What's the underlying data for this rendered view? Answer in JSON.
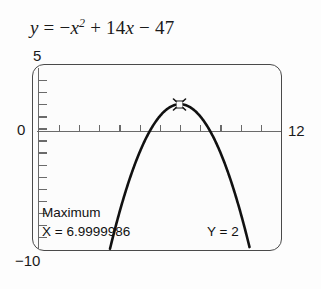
{
  "equation": {
    "lhs": "y",
    "equals": "=",
    "term1_sign": "−",
    "term1_var": "x",
    "term1_exp": "2",
    "term2_sign": "+",
    "term2_coef": "14",
    "term2_var": "x",
    "term3_sign": "−",
    "term3_const": "47",
    "full_text": "y = −x² + 14x − 47"
  },
  "calculator": {
    "readout_label": "Maximum",
    "readout_x": "X = 6.9999986",
    "readout_y": "Y = 2",
    "cursor_icon": "trace-cursor-icon"
  },
  "axis_labels": {
    "y_max": "5",
    "y_min": "−10",
    "x_min": "0",
    "x_max": "12"
  },
  "colors": {
    "curve": "#111111",
    "axis": "#6a6a6a",
    "bezel": "#4a4a4a",
    "screen_bg": "#fcfcfc",
    "text": "#1a1a1a"
  },
  "chart_data": {
    "type": "line",
    "xlabel": "",
    "ylabel": "",
    "xlim": [
      0,
      12
    ],
    "ylim": [
      -10,
      5
    ],
    "xtick_step": 1,
    "ytick_step": 1,
    "grid": false,
    "legend": "none",
    "equation_latex": "y = -x^2 + 14x - 47",
    "coefficients": {
      "a": -1,
      "b": 14,
      "c": -47
    },
    "vertex": {
      "x": 7,
      "y": 2
    },
    "roots": [
      5.5857864,
      8.4142136
    ],
    "annotations": [
      {
        "kind": "trace-cursor",
        "label": "Maximum",
        "x": 6.9999986,
        "y": 2
      }
    ],
    "series": [
      {
        "name": "y = -x^2 + 14x - 47",
        "x": [
          4,
          4.5,
          5,
          5.5,
          6,
          6.5,
          7,
          7.5,
          8,
          8.5,
          9,
          9.5,
          10
        ],
        "values": [
          -7,
          -4.25,
          -2,
          -0.25,
          1,
          1.75,
          2,
          1.75,
          1,
          -0.25,
          -2,
          -4.25,
          -7
        ]
      }
    ]
  }
}
